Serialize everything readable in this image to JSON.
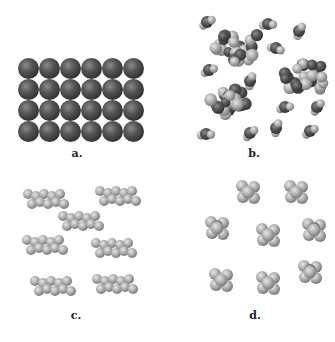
{
  "figure": {
    "panels": [
      {
        "id": "a",
        "label": "a.",
        "description": "atomic solid: square-packed grid of identical dark spheres (6 columns x 4 rows)",
        "label_pos": [
          77,
          153
        ]
      },
      {
        "id": "b",
        "label": "b.",
        "description": "molecular liquid/solid mixture: clusters of small diatomic/triatomic molecules with dark and light atoms",
        "label_pos": [
          254,
          153
        ]
      },
      {
        "id": "c",
        "label": "c.",
        "description": "elongated chain molecules (alkane-like) of light gray spheres, 7 molecules",
        "label_pos": [
          76,
          315
        ]
      },
      {
        "id": "d",
        "label": "d.",
        "description": "compact tetrahedral/branched molecules of light gray spheres, 8 molecules",
        "label_pos": [
          255,
          315
        ]
      }
    ],
    "colors": {
      "dark_atom": "#4a4a4a",
      "light_atom": "#b8b8b8",
      "background": "#ffffff"
    },
    "grid_a": {
      "cols": 6,
      "rows": 4,
      "x0": 18,
      "y0": 58,
      "pitch": 21,
      "radius": 10.5
    }
  }
}
